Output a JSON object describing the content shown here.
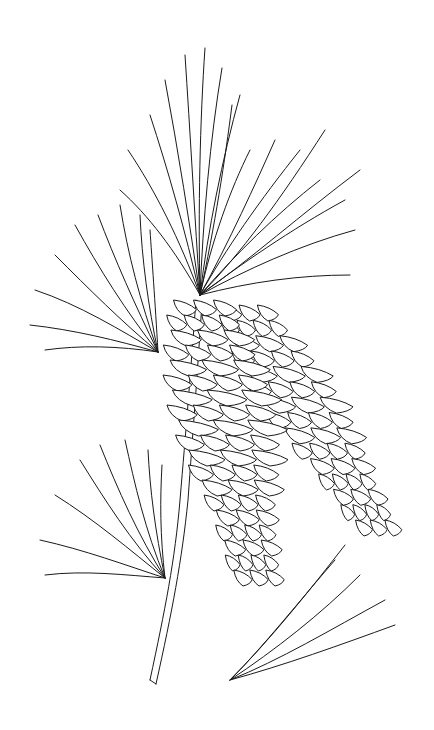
{
  "image": {
    "subject": "Pine branch with needle clusters and two pine cones",
    "style": "black line drawing on white background",
    "colors": {
      "background": "#ffffff",
      "line": "#1a1a1a"
    },
    "elements": [
      {
        "name": "upper-needle-cluster",
        "description": "large fan of long needles at top"
      },
      {
        "name": "left-needle-cluster",
        "description": "fan of needles at left"
      },
      {
        "name": "lower-needle-cluster",
        "description": "fan of needles on lower left"
      },
      {
        "name": "front-pine-cone",
        "description": "large scaled cone, center"
      },
      {
        "name": "back-pine-cone",
        "description": "second cone behind, right"
      },
      {
        "name": "branch-stem",
        "description": "woody stem running down-left"
      },
      {
        "name": "loose-needle-bundle",
        "description": "separate bundle bottom right"
      }
    ]
  }
}
